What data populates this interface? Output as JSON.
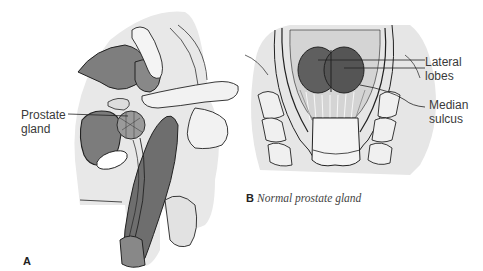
{
  "figure": {
    "panel_a": {
      "letter": "A",
      "labels": {
        "prostate_line1": "Prostate",
        "prostate_line2": "gland"
      },
      "description": "Sagittal view of digital rectal examination with finger palpating prostate gland"
    },
    "panel_b": {
      "letter": "B",
      "caption": "Normal prostate gland",
      "labels": {
        "lateral_line1": "Lateral",
        "lateral_line2": "lobes",
        "median_line1": "Median",
        "median_line2": "sulcus"
      },
      "description": "Posterior view of normal prostate gland showing lateral lobes and median sulcus"
    },
    "colors": {
      "background": "#ffffff",
      "tissue_light": "#e6e6e6",
      "tissue_mid": "#8a8a8a",
      "tissue_dark": "#555555",
      "outline": "#222222",
      "label_text": "#3a3a3a"
    }
  }
}
